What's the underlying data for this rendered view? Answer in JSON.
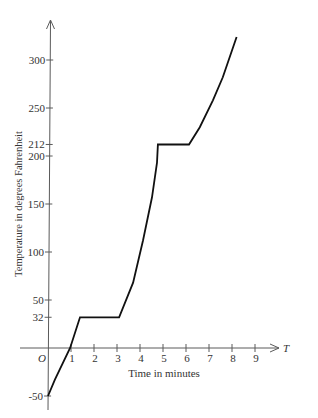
{
  "chart_data": {
    "type": "line",
    "title": "",
    "xlabel": "Time in minutes",
    "ylabel": "Temperature in degrees Fahrenheit",
    "x_axis_name": "T",
    "origin_label": "O",
    "xlim": [
      0,
      9.8
    ],
    "ylim": [
      -60,
      340
    ],
    "grid": false,
    "legend": null,
    "x_ticks": [
      1,
      2,
      3,
      4,
      5,
      6,
      7,
      8,
      9
    ],
    "y_ticks": [
      300,
      250,
      212,
      200,
      150,
      100,
      50,
      32,
      -50
    ],
    "series": [
      {
        "name": "temperature",
        "x": [
          0,
          0.3,
          0.96,
          1.39,
          3.09,
          3.7,
          4.13,
          4.52,
          4.74,
          4.78,
          6.13,
          6.6,
          7.17,
          7.6,
          8.2
        ],
        "y": [
          -50,
          -33,
          0,
          32,
          32,
          68,
          112,
          157,
          193,
          212,
          212,
          230,
          258,
          282,
          324
        ]
      }
    ],
    "annotations": [
      {
        "text": "32",
        "meaning": "freezing plateau from ~1.4 to ~3.1 min"
      },
      {
        "text": "212",
        "meaning": "boiling plateau from ~4.8 to ~6.1 min"
      }
    ]
  }
}
